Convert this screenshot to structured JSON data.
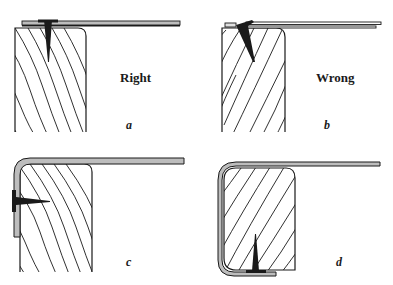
{
  "diagram": {
    "type": "technical-illustration",
    "colors": {
      "ink": "#1a1a1a",
      "background": "#ffffff",
      "sheet_fill": "#bdbdbd"
    },
    "panels": [
      {
        "id": "a",
        "letter": "a",
        "caption": "Right",
        "description": "sheet laid flat on top of board, nail driven vertically through sheet and washer into board"
      },
      {
        "id": "b",
        "letter": "b",
        "caption": "Wrong",
        "description": "sheet on top, nail driven at an angle at the sheet edge"
      },
      {
        "id": "c",
        "letter": "c",
        "caption": "",
        "description": "sheet bent over rounded edge and down the side, nailed horizontally through the side"
      },
      {
        "id": "d",
        "letter": "d",
        "caption": "",
        "description": "sheet wrapped around the side and under the board, nailed vertically from below"
      }
    ]
  }
}
